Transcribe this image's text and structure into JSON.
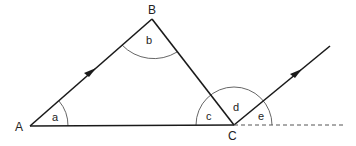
{
  "diagram": {
    "type": "geometry",
    "colors": {
      "line": "#1a1a1a",
      "arc": "#555555",
      "background": "#ffffff"
    },
    "vertices": [
      {
        "id": "A",
        "label": "A"
      },
      {
        "id": "B",
        "label": "B"
      },
      {
        "id": "C",
        "label": "C"
      }
    ],
    "angles": [
      {
        "id": "a",
        "label": "a",
        "at": "A"
      },
      {
        "id": "b",
        "label": "b",
        "at": "B"
      },
      {
        "id": "c",
        "label": "c",
        "at": "C"
      },
      {
        "id": "d",
        "label": "d",
        "at": "C"
      },
      {
        "id": "e",
        "label": "e",
        "at": "C"
      }
    ],
    "segments": [
      {
        "from": "A",
        "to": "B",
        "arrow": true
      },
      {
        "from": "B",
        "to": "C",
        "arrow": false
      },
      {
        "from": "A",
        "to": "C",
        "arrow": false
      },
      {
        "from": "C",
        "to": "ray-end",
        "arrow": true,
        "note": "parallel to AB"
      },
      {
        "from": "C",
        "to": "extension",
        "style": "dashed"
      }
    ]
  }
}
